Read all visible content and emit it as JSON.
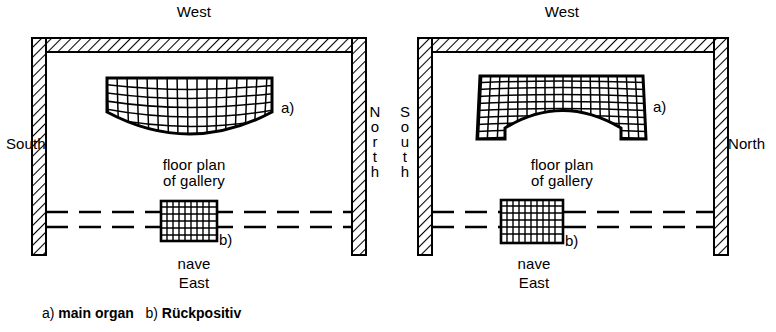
{
  "figure": {
    "kind": "architectural-floor-plan-diagram",
    "panel_count": 2,
    "caption": {
      "item_a_marker": "a)",
      "item_a_label": "main organ",
      "item_b_marker": "b)",
      "item_b_label": "Rückpositiv",
      "full_text": "a) main organ   b) Rückpositiv"
    },
    "colors": {
      "ink": "#000000",
      "background": "#ffffff",
      "hatch": "#000000"
    }
  },
  "panels": [
    {
      "id": "left",
      "name": "gallery-plan-convex",
      "directions": {
        "top": "West",
        "bottom": "East",
        "left": "South",
        "right": "North",
        "left_orientation": "horizontal",
        "right_orientation": "stacked",
        "right_stacked": "N\no\nr\nt\nh"
      },
      "center_text_line1": "floor plan",
      "center_text_line2": "of gallery",
      "bottom_text": "nave",
      "organ": {
        "marker": "a)",
        "shape": "convex-lens",
        "description": "flat top edge with bulging convex bottom arc, curved grid infill"
      },
      "ruckpositiv": {
        "marker": "b)",
        "shape": "rectangle",
        "description": "small grid rectangle straddling two horizontal dashed gallery lines"
      }
    },
    {
      "id": "right",
      "name": "gallery-plan-arched",
      "directions": {
        "top": "West",
        "bottom": "East",
        "left": "South",
        "right": "North",
        "left_orientation": "stacked",
        "left_stacked": "S\no\nu\nt\nh",
        "right_orientation": "horizontal"
      },
      "center_text_line1": "floor plan",
      "center_text_line2": "of gallery",
      "bottom_text": "nave",
      "organ": {
        "marker": "a)",
        "shape": "concave-arch",
        "description": "flat top edge with concave arch cut from the bottom leaving notched side legs, grid infill"
      },
      "ruckpositiv": {
        "marker": "b)",
        "shape": "rectangle",
        "description": "small grid rectangle straddling two horizontal dashed gallery lines"
      }
    }
  ]
}
